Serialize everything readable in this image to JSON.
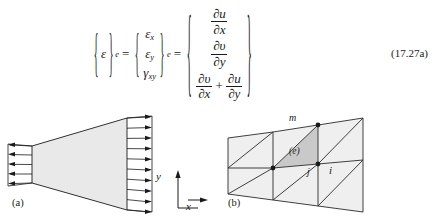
{
  "equation": {
    "lhs": {
      "symbol": "ε",
      "brace_open": "{",
      "brace_close": "}",
      "subscript": "e"
    },
    "equals": "=",
    "strain_vector": {
      "brace_open": "{",
      "brace_close": "}",
      "subscript": "e",
      "components": [
        {
          "symbol": "ε",
          "sub": "x"
        },
        {
          "symbol": "ε",
          "sub": "y"
        },
        {
          "symbol": "γ",
          "sub": "xy"
        }
      ]
    },
    "derivative_vector": {
      "brace_open": "{",
      "brace_close": "}",
      "rows": [
        {
          "type": "fraction",
          "numerator": "∂u",
          "denominator": "∂x"
        },
        {
          "type": "fraction",
          "numerator": "∂υ",
          "denominator": "∂y"
        },
        {
          "type": "sum",
          "operator": "+",
          "terms": [
            {
              "numerator": "∂υ",
              "denominator": "∂x"
            },
            {
              "numerator": "∂u",
              "denominator": "∂y"
            }
          ]
        }
      ]
    },
    "number": "(17.27a)"
  },
  "figures": {
    "a": {
      "caption": "(a)",
      "description": "tapered-plate-with-distributed-edge-loads",
      "left_arrow_count": 5,
      "right_arrow_count": 10,
      "left_arrow_direction": "left",
      "right_arrow_direction": "right",
      "fill_color": "#e8e8e8",
      "outline_color": "#1a1a1a",
      "axes": {
        "y_label": "y",
        "x_label": "x"
      }
    },
    "b": {
      "caption": "(b)",
      "description": "triangular-finite-element-mesh-on-tapered-strip",
      "columns": 3,
      "rows": 2,
      "element_fill": "#eeeeee",
      "highlight_fill": "#c9c9c9",
      "outline_color": "#2a2a2a",
      "node_labels": {
        "m": "m",
        "j": "j",
        "i": "i",
        "element": "(e)"
      }
    }
  }
}
